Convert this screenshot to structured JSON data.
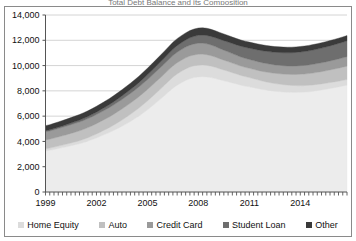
{
  "title_sliver": "Total Debt Balance and its Composition",
  "legend": {
    "position": "bottom",
    "items": [
      {
        "label": "Home Equity",
        "color": "#dcdcdc",
        "name": "legend-home-equity"
      },
      {
        "label": "Auto",
        "color": "#c0c0c0",
        "name": "legend-auto"
      },
      {
        "label": "Credit Card",
        "color": "#9a9a9a",
        "name": "legend-credit-card"
      },
      {
        "label": "Student Loan",
        "color": "#6e6e6e",
        "name": "legend-student-loan"
      },
      {
        "label": "Other",
        "color": "#3a3a3a",
        "name": "legend-other"
      }
    ]
  },
  "chart_data": {
    "type": "area",
    "stacked": true,
    "title": "Total Debt Balance and its Composition",
    "xlabel": "",
    "ylabel": "",
    "grid": true,
    "ylim": [
      0,
      14000
    ],
    "yticks": [
      0,
      2000,
      4000,
      6000,
      8000,
      10000,
      12000,
      14000
    ],
    "ytick_labels": [
      "0",
      "2,000",
      "4,000",
      "6,000",
      "8,000",
      "10,000",
      "12,000",
      "14,000"
    ],
    "xlim": [
      1999,
      2016.75
    ],
    "xticks": [
      1999,
      2002,
      2005,
      2008,
      2011,
      2014
    ],
    "xtick_labels": [
      "1999",
      "2002",
      "2005",
      "2008",
      "2011",
      "2014"
    ],
    "x": [
      1999.0,
      1999.25,
      1999.5,
      1999.75,
      2000.0,
      2000.25,
      2000.5,
      2000.75,
      2001.0,
      2001.25,
      2001.5,
      2001.75,
      2002.0,
      2002.25,
      2002.5,
      2002.75,
      2003.0,
      2003.25,
      2003.5,
      2003.75,
      2004.0,
      2004.25,
      2004.5,
      2004.75,
      2005.0,
      2005.25,
      2005.5,
      2005.75,
      2006.0,
      2006.25,
      2006.5,
      2006.75,
      2007.0,
      2007.25,
      2007.5,
      2007.75,
      2008.0,
      2008.25,
      2008.5,
      2008.75,
      2009.0,
      2009.25,
      2009.5,
      2009.75,
      2010.0,
      2010.25,
      2010.5,
      2010.75,
      2011.0,
      2011.25,
      2011.5,
      2011.75,
      2012.0,
      2012.25,
      2012.5,
      2012.75,
      2013.0,
      2013.25,
      2013.5,
      2013.75,
      2014.0,
      2014.25,
      2014.5,
      2014.75,
      2015.0,
      2015.25,
      2015.5,
      2015.75,
      2016.0,
      2016.25,
      2016.5,
      2016.75
    ],
    "series": [
      {
        "name": "Mortgage",
        "color": "#ececec",
        "note": "bottom band, unlabeled in legend",
        "values": [
          3250,
          3300,
          3370,
          3440,
          3510,
          3580,
          3660,
          3740,
          3820,
          3920,
          4030,
          4150,
          4280,
          4420,
          4560,
          4700,
          4860,
          5030,
          5200,
          5390,
          5580,
          5790,
          6010,
          6250,
          6500,
          6770,
          7050,
          7330,
          7620,
          7920,
          8210,
          8450,
          8640,
          8820,
          8960,
          9050,
          9100,
          9120,
          9100,
          9050,
          8970,
          8880,
          8800,
          8720,
          8630,
          8540,
          8450,
          8380,
          8320,
          8250,
          8180,
          8110,
          8060,
          8010,
          7970,
          7940,
          7910,
          7890,
          7880,
          7880,
          7890,
          7900,
          7930,
          7970,
          8020,
          8070,
          8130,
          8190,
          8250,
          8310,
          8380,
          8450
        ]
      },
      {
        "name": "Home Equity",
        "color": "#dcdcdc",
        "values": [
          170,
          175,
          180,
          190,
          200,
          210,
          220,
          230,
          240,
          255,
          270,
          290,
          310,
          335,
          360,
          390,
          420,
          455,
          490,
          525,
          560,
          595,
          630,
          665,
          700,
          730,
          760,
          790,
          820,
          845,
          870,
          890,
          905,
          915,
          925,
          930,
          935,
          930,
          920,
          905,
          890,
          870,
          850,
          830,
          810,
          790,
          770,
          750,
          730,
          710,
          690,
          670,
          650,
          630,
          610,
          595,
          580,
          565,
          550,
          540,
          530,
          520,
          510,
          500,
          490,
          480,
          470,
          465,
          460,
          455,
          450,
          445
        ]
      },
      {
        "name": "Auto",
        "color": "#c0c0c0",
        "values": [
          700,
          705,
          715,
          725,
          735,
          745,
          755,
          765,
          775,
          785,
          795,
          805,
          815,
          825,
          835,
          845,
          855,
          865,
          875,
          885,
          890,
          895,
          900,
          905,
          905,
          905,
          905,
          905,
          900,
          895,
          890,
          885,
          880,
          875,
          870,
          865,
          860,
          850,
          840,
          825,
          810,
          795,
          780,
          765,
          755,
          745,
          740,
          735,
          735,
          740,
          750,
          760,
          775,
          790,
          805,
          820,
          835,
          850,
          865,
          880,
          895,
          910,
          925,
          940,
          955,
          970,
          985,
          1000,
          1015,
          1030,
          1045,
          1060
        ]
      },
      {
        "name": "Credit Card",
        "color": "#9a9a9a",
        "values": [
          640,
          645,
          655,
          665,
          675,
          685,
          690,
          695,
          700,
          705,
          710,
          715,
          720,
          725,
          730,
          735,
          740,
          745,
          750,
          755,
          760,
          765,
          770,
          775,
          780,
          785,
          790,
          795,
          800,
          810,
          820,
          830,
          840,
          850,
          860,
          870,
          875,
          870,
          860,
          845,
          830,
          810,
          790,
          770,
          750,
          735,
          720,
          710,
          700,
          695,
          690,
          685,
          680,
          675,
          670,
          670,
          665,
          665,
          665,
          670,
          675,
          680,
          685,
          690,
          695,
          700,
          705,
          710,
          720,
          730,
          740,
          750
        ]
      },
      {
        "name": "Student Loan",
        "color": "#6e6e6e",
        "values": [
          90,
          95,
          100,
          105,
          110,
          120,
          130,
          140,
          150,
          160,
          170,
          180,
          190,
          205,
          220,
          235,
          250,
          265,
          280,
          295,
          310,
          325,
          340,
          360,
          380,
          400,
          420,
          440,
          460,
          480,
          500,
          520,
          540,
          560,
          580,
          600,
          620,
          640,
          660,
          680,
          700,
          725,
          750,
          775,
          800,
          825,
          850,
          870,
          890,
          910,
          930,
          950,
          965,
          980,
          995,
          1010,
          1025,
          1040,
          1055,
          1070,
          1085,
          1100,
          1115,
          1130,
          1145,
          1160,
          1175,
          1190,
          1205,
          1220,
          1235,
          1250
        ]
      },
      {
        "name": "Other",
        "color": "#3a3a3a",
        "values": [
          400,
          405,
          410,
          415,
          420,
          425,
          430,
          435,
          440,
          445,
          450,
          455,
          460,
          465,
          470,
          475,
          480,
          485,
          490,
          495,
          500,
          505,
          510,
          515,
          520,
          525,
          530,
          535,
          540,
          545,
          550,
          555,
          560,
          565,
          570,
          575,
          580,
          575,
          570,
          560,
          550,
          540,
          530,
          520,
          510,
          500,
          490,
          485,
          480,
          475,
          470,
          465,
          460,
          455,
          450,
          448,
          445,
          443,
          440,
          438,
          436,
          434,
          432,
          430,
          428,
          426,
          424,
          422,
          420,
          418,
          416,
          414
        ]
      }
    ]
  }
}
